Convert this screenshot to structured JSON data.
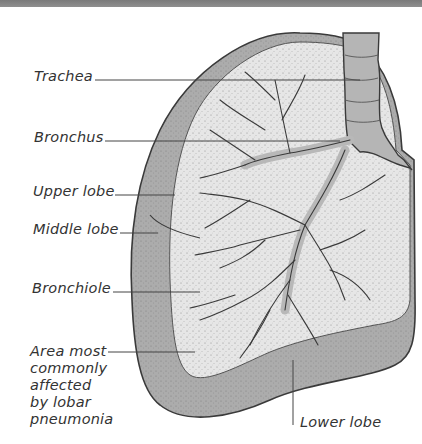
{
  "figure": {
    "colors": {
      "background": "#ffffff",
      "top_band": "#858585",
      "outer_lung": "#a9a9a9",
      "inner_lung": "#e4e4e4",
      "airways": "#b8b8b8",
      "outline": "#3a3a3a",
      "leader_line": "#444444",
      "text": "#333333"
    }
  },
  "labels": [
    {
      "id": "trachea",
      "text": "Trachea"
    },
    {
      "id": "bronchus",
      "text": "Bronchus"
    },
    {
      "id": "upper_lobe",
      "text": "Upper lobe"
    },
    {
      "id": "middle_lobe",
      "text": "Middle lobe"
    },
    {
      "id": "bronchiole",
      "text": "Bronchiole"
    },
    {
      "id": "area_affected",
      "text": "Area most commonly affected by lobar pneumonia"
    },
    {
      "id": "lower_lobe",
      "text": "Lower lobe"
    }
  ]
}
